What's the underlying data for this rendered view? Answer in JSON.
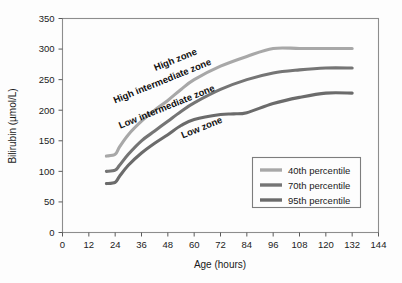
{
  "chart_data": {
    "type": "line",
    "title": "",
    "xlabel": "Age (hours)",
    "ylabel": "Bilirubin (µmol/L)",
    "xlim": [
      0,
      144
    ],
    "ylim": [
      0,
      350
    ],
    "xticks": [
      0,
      12,
      24,
      36,
      48,
      60,
      72,
      84,
      96,
      108,
      120,
      132,
      144
    ],
    "yticks": [
      0,
      50,
      100,
      150,
      200,
      250,
      300,
      350
    ],
    "grid": false,
    "legend_position": "lower-right",
    "series": [
      {
        "name": "40th percentile",
        "color": "#a8a8a8",
        "x": [
          20,
          24,
          26,
          30,
          36,
          42,
          48,
          54,
          60,
          72,
          84,
          96,
          108,
          120,
          132
        ],
        "values": [
          125,
          128,
          140,
          160,
          182,
          200,
          216,
          234,
          250,
          272,
          288,
          301,
          301,
          301,
          301
        ]
      },
      {
        "name": "70th percentile",
        "color": "#757575",
        "x": [
          20,
          24,
          26,
          30,
          36,
          42,
          48,
          54,
          60,
          72,
          84,
          96,
          108,
          120,
          132
        ],
        "values": [
          100,
          102,
          110,
          128,
          150,
          166,
          182,
          198,
          212,
          234,
          250,
          261,
          266,
          269,
          269
        ]
      },
      {
        "name": "95th percentile",
        "color": "#6b6b6b",
        "x": [
          20,
          24,
          26,
          30,
          36,
          42,
          48,
          54,
          60,
          72,
          78,
          84,
          96,
          108,
          120,
          132
        ],
        "values": [
          80,
          82,
          92,
          110,
          130,
          146,
          160,
          175,
          185,
          193,
          194,
          196,
          211,
          221,
          228,
          228
        ]
      }
    ],
    "annotations": [
      {
        "text": "High zone",
        "x": 52,
        "y": 278,
        "rotation": -22
      },
      {
        "text": "High intermediate zone",
        "x": 46,
        "y": 243,
        "rotation": -22
      },
      {
        "text": "Low intermediate zone",
        "x": 48,
        "y": 201,
        "rotation": -22
      },
      {
        "text": "Low zone",
        "x": 64,
        "y": 167,
        "rotation": -22
      }
    ]
  },
  "axes": {
    "x_title": "Age (hours)",
    "y_title": "Bilirubin (µmol/L)",
    "x_tick_labels": [
      "0",
      "12",
      "24",
      "36",
      "48",
      "60",
      "72",
      "84",
      "96",
      "108",
      "120",
      "132",
      "144"
    ],
    "y_tick_labels": [
      "0",
      "50",
      "100",
      "150",
      "200",
      "250",
      "300",
      "350"
    ]
  },
  "zones": {
    "high": "High zone",
    "high_intermediate": "High intermediate zone",
    "low_intermediate": "Low intermediate zone",
    "low": "Low zone"
  },
  "legend": {
    "entries": [
      {
        "label": "40th percentile",
        "color": "#a8a8a8"
      },
      {
        "label": "70th percentile",
        "color": "#757575"
      },
      {
        "label": "95th percentile",
        "color": "#6b6b6b"
      }
    ]
  },
  "colors": {
    "background": "#fdfdfd",
    "frame": "#8d8d8d",
    "text": "#1a1a1a"
  }
}
